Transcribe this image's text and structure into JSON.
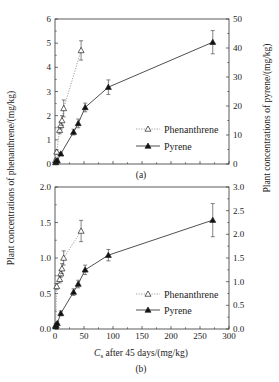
{
  "chart_data": [
    {
      "type": "line",
      "panel_label": "(a)",
      "xlabel": "",
      "ylabel_left": "Plant concentrations of phenanthrene/(mg/kg)",
      "ylabel_right": "Plant concentrations of pyrene/(mg/kg)",
      "xlim": [
        0,
        300
      ],
      "ylim_left": [
        0,
        6
      ],
      "ylim_right": [
        0,
        50
      ],
      "yticks_left": [
        "0",
        "1",
        "2",
        "3",
        "4",
        "5",
        "6"
      ],
      "yticks_right": [
        "0",
        "10",
        "20",
        "30",
        "40",
        "50"
      ],
      "grid": false,
      "legend_position": "lower right",
      "series": [
        {
          "name": "Phenanthrene",
          "axis": "left",
          "marker": "open-triangle",
          "line": "dotted",
          "x": [
            1,
            3,
            8,
            10,
            12,
            15,
            45
          ],
          "y": [
            0.15,
            0.5,
            1.4,
            1.6,
            1.8,
            2.3,
            4.7
          ],
          "err": [
            0.05,
            0.08,
            0.15,
            0.15,
            0.2,
            0.35,
            0.4
          ]
        },
        {
          "name": "Pyrene",
          "axis": "right",
          "marker": "filled-triangle",
          "line": "solid",
          "x": [
            1,
            2,
            4,
            10,
            32,
            40,
            52,
            92,
            272
          ],
          "y": [
            0.5,
            1,
            1.2,
            3.5,
            11,
            14,
            19.5,
            26.5,
            42
          ],
          "err": [
            0.2,
            0.2,
            0.3,
            0.5,
            1,
            1.5,
            1.5,
            2.5,
            4
          ]
        }
      ]
    },
    {
      "type": "line",
      "panel_label": "(b)",
      "xlabel": "Cs after 45 days/(mg/kg)",
      "ylabel_left": "Plant concentrations of phenanthrene/(mg/kg)",
      "ylabel_right": "Plant concentrations of pyrene/(mg/kg)",
      "xlim": [
        0,
        300
      ],
      "ylim_left": [
        0,
        2.0
      ],
      "ylim_right": [
        0,
        3.0
      ],
      "xticks": [
        "0",
        "50",
        "100",
        "150",
        "200",
        "250",
        "300"
      ],
      "yticks_left": [
        "0.0",
        "0.5",
        "1.0",
        "1.5",
        "2.0"
      ],
      "yticks_right": [
        "0.0",
        "0.5",
        "1.0",
        "1.5",
        "2.0",
        "2.5",
        "3.0"
      ],
      "grid": false,
      "legend_position": "lower right",
      "series": [
        {
          "name": "Phenanthrene",
          "axis": "left",
          "marker": "open-triangle",
          "line": "dotted",
          "x": [
            1,
            3,
            8,
            10,
            12,
            15,
            45
          ],
          "y": [
            0.05,
            0.6,
            0.7,
            0.78,
            0.85,
            1.0,
            1.38
          ],
          "err": [
            0.02,
            0.04,
            0.05,
            0.05,
            0.07,
            0.1,
            0.15
          ]
        },
        {
          "name": "Pyrene",
          "axis": "right",
          "marker": "filled-triangle",
          "line": "solid",
          "x": [
            1,
            2,
            4,
            10,
            32,
            40,
            52,
            92,
            272
          ],
          "y": [
            0.05,
            0.08,
            0.12,
            0.33,
            0.78,
            0.95,
            1.25,
            1.56,
            2.3
          ],
          "err": [
            0.02,
            0.02,
            0.03,
            0.05,
            0.07,
            0.08,
            0.1,
            0.12,
            0.35
          ]
        }
      ]
    }
  ],
  "labels": {
    "ylabel_left": "Plant concentrations of  phenanthrene/(mg/kg)",
    "ylabel_right": "Plant concentrations of  pyrene/(mg/kg)",
    "xlabel_sym": "C",
    "xlabel_sub": "s",
    "xlabel_rest": " after 45 days/(mg/kg)",
    "panel_a": "(a)",
    "panel_b": "(b)",
    "legend_phen": "Phenanthrene",
    "legend_pyr": "Pyrene"
  }
}
